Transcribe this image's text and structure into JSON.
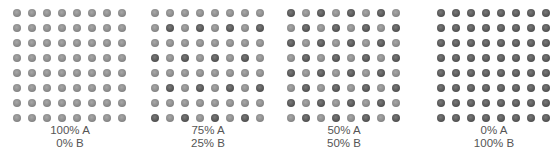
{
  "colors": {
    "A": "#8c8c8c",
    "B": "#585858",
    "text": "#555555"
  },
  "panels": [
    {
      "label_a": "100% A",
      "label_b": "0% B",
      "left": 10,
      "pattern": "all-A",
      "grid": [
        "AAAAAAAA",
        "AAAAAAAA",
        "AAAAAAAA",
        "AAAAAAAA",
        "AAAAAAAA",
        "AAAAAAAA",
        "AAAAAAAA",
        "AAAAAAAA"
      ]
    },
    {
      "label_a": "75% A",
      "label_b": "25% B",
      "left": 148,
      "pattern": "quarter-B",
      "grid": [
        "AAAAAAAA",
        "ABABABAB",
        "AAAAAAAA",
        "BABABABA",
        "AAAAAAAA",
        "ABABABAB",
        "AAAAAAAA",
        "BABABABA"
      ]
    },
    {
      "label_a": "50% A",
      "label_b": "50% B",
      "left": 284,
      "pattern": "checkerboard",
      "grid": [
        "BABABABA",
        "ABABABAB",
        "BABABABA",
        "ABABABAB",
        "BABABABA",
        "ABABABAB",
        "BABABABA",
        "ABABABAB"
      ]
    },
    {
      "label_a": "0% A",
      "label_b": "100% B",
      "left": 434,
      "pattern": "all-B",
      "grid": [
        "BBBBBBBB",
        "BBBBBBBB",
        "BBBBBBBB",
        "BBBBBBBB",
        "BBBBBBBB",
        "BBBBBBBB",
        "BBBBBBBB",
        "BBBBBBBB"
      ]
    }
  ]
}
